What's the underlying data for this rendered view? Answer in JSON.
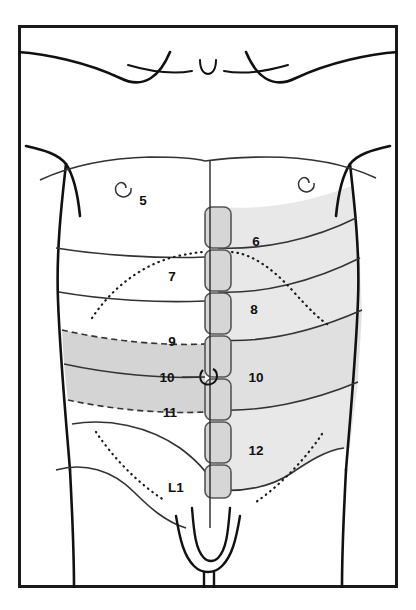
{
  "figure": {
    "view": "anterior",
    "frame": {
      "border_color": "#1a1a1a",
      "border_width_px": 3,
      "background_color": "#ffffff",
      "x": 18,
      "y": 25,
      "width": 380,
      "height": 563
    },
    "colors": {
      "outline": "#111111",
      "segment_line": "#333333",
      "shade_light": "#e6e6e6",
      "shade_mid": "#d8d8d8",
      "shade_dark": "#c9c9c9",
      "midline_strip_fill": "#d4d4d4",
      "midline_strip_stroke": "#555555",
      "label_color": "#111111",
      "dotted_color": "#1a1a1a"
    }
  },
  "labels": {
    "left_column": [
      {
        "id": "label-5",
        "text": "5",
        "x": 143,
        "y": 205
      },
      {
        "id": "label-7",
        "text": "7",
        "x": 172,
        "y": 281
      },
      {
        "id": "label-9",
        "text": "9",
        "x": 172,
        "y": 341
      },
      {
        "id": "label-10",
        "text": "10",
        "x": 167,
        "y": 378
      },
      {
        "id": "label-11",
        "text": "11",
        "x": 170,
        "y": 414
      },
      {
        "id": "label-L1",
        "text": "L1",
        "x": 170,
        "y": 488
      }
    ],
    "right_column": [
      {
        "id": "label-6",
        "text": "6",
        "x": 252,
        "y": 241
      },
      {
        "id": "label-8",
        "text": "8",
        "x": 250,
        "y": 310
      },
      {
        "id": "label-10-right",
        "text": "10",
        "x": 247,
        "y": 378
      },
      {
        "id": "label-12",
        "text": "12",
        "x": 248,
        "y": 450
      }
    ]
  },
  "landmarks": [
    {
      "id": "suprasternal-notch",
      "name": "suprasternal notch",
      "x": 208,
      "y": 63
    },
    {
      "id": "nipple-left",
      "name": "nipple",
      "x": 122,
      "y": 192
    },
    {
      "id": "nipple-right",
      "name": "nipple",
      "x": 305,
      "y": 186
    },
    {
      "id": "umbilicus",
      "name": "umbilicus",
      "x": 210,
      "y": 376
    }
  ],
  "dermatome_bands": [
    {
      "id": "band-T5",
      "level": "5",
      "side": "left",
      "shade": "none"
    },
    {
      "id": "band-T6",
      "level": "6",
      "side": "right",
      "shade": "light"
    },
    {
      "id": "band-T7",
      "level": "7",
      "side": "left",
      "shade": "none"
    },
    {
      "id": "band-T8",
      "level": "8",
      "side": "right",
      "shade": "light"
    },
    {
      "id": "band-T9",
      "level": "9",
      "side": "left",
      "shade": "dark"
    },
    {
      "id": "band-T10",
      "level": "10",
      "side": "both",
      "shade": "dark"
    },
    {
      "id": "band-T11",
      "level": "11",
      "side": "left",
      "shade": "dark"
    },
    {
      "id": "band-T12",
      "level": "12",
      "side": "right",
      "shade": "light"
    },
    {
      "id": "band-L1",
      "level": "L1",
      "side": "left",
      "shade": "none"
    }
  ],
  "midline_strip": {
    "id": "midline-vertebral-strip",
    "name": "midline segment strip",
    "x": 205,
    "width": 26,
    "segments": [
      {
        "y": 207,
        "height": 41
      },
      {
        "y": 250,
        "height": 41
      },
      {
        "y": 293,
        "height": 41
      },
      {
        "y": 336,
        "height": 41
      },
      {
        "y": 379,
        "height": 41
      },
      {
        "y": 422,
        "height": 41
      },
      {
        "y": 465,
        "height": 33
      }
    ]
  },
  "guide_lines": {
    "costal_margin_left": "dotted arch from mid-left costal margin up toward xiphoid",
    "costal_margin_right": "dotted arch from xiphoid down to right costal margin",
    "inguinal_left": "dotted oblique line over left inguinal region",
    "inguinal_right": "dotted oblique line over right inguinal region"
  }
}
